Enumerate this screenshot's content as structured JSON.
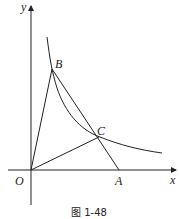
{
  "figure": {
    "caption": "图 1-48",
    "axes": {
      "x_label": "x",
      "y_label": "y",
      "origin_label": "O"
    },
    "points": [
      {
        "name": "B",
        "label": "B"
      },
      {
        "name": "C",
        "label": "C"
      },
      {
        "name": "A",
        "label": "A"
      },
      {
        "name": "O",
        "label": "O"
      }
    ],
    "labels": {
      "B": "B",
      "C": "C",
      "A": "A"
    },
    "curve": "hyperbola y = k/x (first quadrant)",
    "segments": [
      "OB",
      "OC",
      "BA",
      "BC"
    ]
  }
}
